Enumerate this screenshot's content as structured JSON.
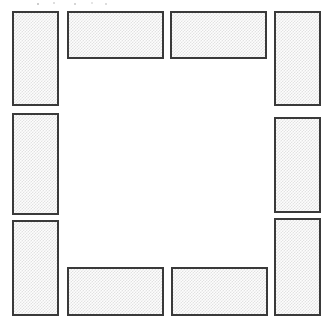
{
  "diagram": {
    "canvas": {
      "width": 333,
      "height": 327
    },
    "style": {
      "background_color": "#ffffff",
      "block_border_color": "#3a3a3a",
      "block_border_width_px": 2,
      "block_fill_color": "#e2e2e2",
      "block_fill_pattern": "fine-dither-checkerboard"
    },
    "blocks": [
      {
        "id": "left-top",
        "label": "Left Top Table",
        "orientation": "vertical",
        "x": 12,
        "y": 11,
        "width": 47,
        "height": 95
      },
      {
        "id": "left-middle",
        "label": "Left Middle Table",
        "orientation": "vertical",
        "x": 12,
        "y": 113,
        "width": 47,
        "height": 102
      },
      {
        "id": "left-bottom",
        "label": "Left Bottom Table",
        "orientation": "vertical",
        "x": 12,
        "y": 220,
        "width": 47,
        "height": 96
      },
      {
        "id": "top-left",
        "label": "Top Left Table",
        "orientation": "horizontal",
        "x": 67,
        "y": 11,
        "width": 97,
        "height": 48
      },
      {
        "id": "top-right",
        "label": "Top Right Table",
        "orientation": "horizontal",
        "x": 170,
        "y": 11,
        "width": 97,
        "height": 48
      },
      {
        "id": "right-top",
        "label": "Right Top Table",
        "orientation": "vertical",
        "x": 274,
        "y": 11,
        "width": 47,
        "height": 95
      },
      {
        "id": "right-middle",
        "label": "Right Middle Table",
        "orientation": "vertical",
        "x": 274,
        "y": 117,
        "width": 47,
        "height": 96
      },
      {
        "id": "right-bottom",
        "label": "Right Bottom Table",
        "orientation": "vertical",
        "x": 274,
        "y": 218,
        "width": 47,
        "height": 98
      },
      {
        "id": "bottom-left",
        "label": "Bottom Left Table",
        "orientation": "horizontal",
        "x": 67,
        "y": 267,
        "width": 97,
        "height": 49
      },
      {
        "id": "bottom-right",
        "label": "Bottom Right Table",
        "orientation": "horizontal",
        "x": 171,
        "y": 267,
        "width": 97,
        "height": 49
      }
    ]
  }
}
